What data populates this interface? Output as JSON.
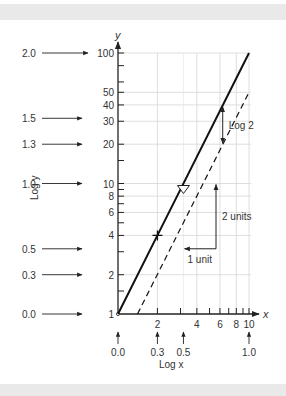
{
  "chart_data": {
    "type": "line",
    "title": "",
    "scale": "log-log",
    "xlabel": "x",
    "ylabel": "y",
    "x_log_label": "Log x",
    "y_log_label": "Log y",
    "x_range": [
      1,
      10
    ],
    "y_range": [
      1,
      100
    ],
    "x_tick_values": [
      1,
      2,
      3,
      4,
      5,
      6,
      7,
      8,
      9,
      10
    ],
    "x_tick_labels": [
      {
        "value": 2,
        "label": "2"
      },
      {
        "value": 4,
        "label": "4"
      },
      {
        "value": 6,
        "label": "6"
      },
      {
        "value": 8,
        "label": "8"
      },
      {
        "value": 10,
        "label": "10"
      }
    ],
    "y_tick_values": [
      1,
      1.5,
      2,
      3,
      4,
      5,
      6,
      7,
      8,
      9,
      10,
      15,
      20,
      30,
      40,
      50,
      60,
      80,
      100
    ],
    "y_tick_labels": [
      {
        "value": 1,
        "label": "1"
      },
      {
        "value": 2,
        "label": "2"
      },
      {
        "value": 4,
        "label": "4"
      },
      {
        "value": 6,
        "label": "6"
      },
      {
        "value": 8,
        "label": "8"
      },
      {
        "value": 10,
        "label": "10"
      },
      {
        "value": 20,
        "label": "20"
      },
      {
        "value": 30,
        "label": "30"
      },
      {
        "value": 40,
        "label": "40"
      },
      {
        "value": 50,
        "label": "50"
      },
      {
        "value": 100,
        "label": "100"
      }
    ],
    "x_log_markers": [
      {
        "value": 1,
        "label": "0.0"
      },
      {
        "value": 2,
        "label": "0.3"
      },
      {
        "value": 3.16,
        "label": "0.5"
      },
      {
        "value": 10,
        "label": "1.0"
      }
    ],
    "y_log_markers": [
      {
        "value": 100,
        "label": "2.0"
      },
      {
        "value": 31.6,
        "label": "1.5"
      },
      {
        "value": 20,
        "label": "1.3"
      },
      {
        "value": 10,
        "label": "1.0"
      },
      {
        "value": 3.16,
        "label": "0.5"
      },
      {
        "value": 2,
        "label": "0.3"
      },
      {
        "value": 1,
        "label": "0.0"
      }
    ],
    "grid": true,
    "series": [
      {
        "name": "y = x^2",
        "style": "solid",
        "points": [
          [
            1,
            1
          ],
          [
            2,
            4
          ],
          [
            10,
            100
          ]
        ]
      },
      {
        "name": "y = x^2 / 2",
        "style": "dashed",
        "points": [
          [
            1.41,
            1
          ],
          [
            10,
            50
          ]
        ]
      }
    ],
    "markers": [
      {
        "type": "plus",
        "x": 2,
        "y": 4
      },
      {
        "type": "triangle-down",
        "x": 3.16,
        "y": 10
      }
    ],
    "annotations": [
      {
        "text": "1 unit",
        "type": "horizontal-arrow",
        "from": [
          3.16,
          3.16
        ],
        "to": [
          5.6,
          3.16
        ]
      },
      {
        "text": "2 units",
        "type": "vertical-arrow",
        "from": [
          5.6,
          3.16
        ],
        "to": [
          5.6,
          10
        ]
      },
      {
        "text": "Log 2",
        "type": "double-arrow",
        "from": [
          6.3,
          40
        ],
        "to": [
          6.3,
          20
        ]
      }
    ]
  }
}
